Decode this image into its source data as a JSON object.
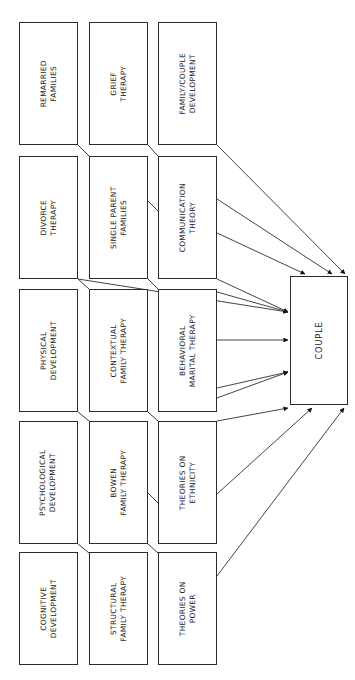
{
  "diagram": {
    "title": "COUPLE",
    "type": "flowchart",
    "orientation": "rotated-90",
    "background_color": "#ffffff",
    "line_color": "#2b2b2b",
    "text_color": "#1a1a1a",
    "center_node": {
      "id": "couple",
      "label": "COUPLE",
      "lines": [
        "COUPLE"
      ],
      "x": 290,
      "y": 276,
      "width": 58,
      "height": 129
    },
    "columns": [
      {
        "id": "col-1",
        "x": 19,
        "width": 59
      },
      {
        "id": "col-2",
        "x": 89,
        "width": 59
      },
      {
        "id": "col-3",
        "x": 158,
        "width": 59
      }
    ],
    "rows": [
      {
        "id": "row-1",
        "y": 22,
        "height": 123
      },
      {
        "id": "row-2",
        "y": 156,
        "height": 123
      },
      {
        "id": "row-3",
        "y": 289,
        "height": 123
      },
      {
        "id": "row-4",
        "y": 421,
        "height": 123
      },
      {
        "id": "row-5",
        "y": 552,
        "height": 113
      }
    ],
    "nodes": [
      {
        "id": "remarried-families",
        "row": 0,
        "col": 0,
        "label": "REMARRIED FAMILIES",
        "lines": [
          "REMARRIED",
          "FAMILIES"
        ]
      },
      {
        "id": "grief-therapy",
        "row": 0,
        "col": 1,
        "label": "GRIEF THERAPY",
        "lines": [
          "GRIEF",
          "THERAPY"
        ]
      },
      {
        "id": "family-couple-development",
        "row": 0,
        "col": 2,
        "label": "FAMILY/COUPLE DEVELOPMENT",
        "lines": [
          "FAMILY/COUPLE",
          "DEVELOPMENT"
        ]
      },
      {
        "id": "divorce-therapy",
        "row": 1,
        "col": 0,
        "label": "DIVORCE THERAPY",
        "lines": [
          "DIVORCE",
          "THERAPY"
        ]
      },
      {
        "id": "single-parent-families",
        "row": 1,
        "col": 1,
        "label": "SINGLE PARENT FAMILIES",
        "lines": [
          "SINGLE PARENT",
          "FAMILIES"
        ]
      },
      {
        "id": "communication-theory",
        "row": 1,
        "col": 2,
        "label": "COMMUNICATION THEORY",
        "lines": [
          "COMMUNICATION",
          "THEORY"
        ]
      },
      {
        "id": "physical-development",
        "row": 2,
        "col": 0,
        "label": "PHYSICAL DEVELOPMENT",
        "lines": [
          "PHYSICAL",
          "DEVELOPMENT"
        ]
      },
      {
        "id": "contextual-family-therapy",
        "row": 2,
        "col": 1,
        "label": "CONTEXTUAL FAMILY THERAPY",
        "lines": [
          "CONTEXTUAL",
          "FAMILY THERAPY"
        ]
      },
      {
        "id": "behavioral-marital-therapy",
        "row": 2,
        "col": 2,
        "label": "BEHAVIORAL MARITAL THERAPY",
        "lines": [
          "BEHAVIORAL",
          "MARITAL THERAPY"
        ]
      },
      {
        "id": "psychological-development",
        "row": 3,
        "col": 0,
        "label": "PSYCHOLOGICAL DEVELOPMENT",
        "lines": [
          "PSYCHOLOGICAL",
          "DEVELOPMENT"
        ]
      },
      {
        "id": "bowen-family-therapy",
        "row": 3,
        "col": 1,
        "label": "BOWEN FAMILY THERAPY",
        "lines": [
          "BOWEN",
          "FAMILY THERAPY"
        ]
      },
      {
        "id": "theories-on-ethnicity",
        "row": 3,
        "col": 2,
        "label": "THEORIES ON ETHNICITY",
        "lines": [
          "THEORIES ON",
          "ETHNICITY"
        ]
      },
      {
        "id": "cognitive-development",
        "row": 4,
        "col": 0,
        "label": "COGNITIVE DEVELOPMENT",
        "lines": [
          "COGNITIVE",
          "DEVELOPMENT"
        ]
      },
      {
        "id": "structural-family-therapy",
        "row": 4,
        "col": 1,
        "label": "STRUCTURAL FAMILY THERAPY",
        "lines": [
          "STRUCTURAL",
          "FAMILY THERAPY"
        ]
      },
      {
        "id": "theories-on-power",
        "row": 4,
        "col": 2,
        "label": "THEORIES ON POWER",
        "lines": [
          "THEORIES ON",
          "POWER"
        ]
      }
    ],
    "connectors": [
      {
        "id": "link-remarried-to-single-parent",
        "from": "remarried-families",
        "to": "single-parent-families",
        "kind": "plain"
      },
      {
        "id": "link-grief-to-communication",
        "from": "grief-therapy",
        "to": "communication-theory",
        "kind": "plain"
      },
      {
        "id": "link-single-parent-to-communication",
        "from": "single-parent-families",
        "to": "communication-theory",
        "kind": "plain"
      },
      {
        "id": "link-divorce-to-contextual",
        "from": "divorce-therapy",
        "to": "contextual-family-therapy",
        "kind": "plain"
      },
      {
        "id": "link-single-parent-to-behavioral",
        "from": "single-parent-families",
        "to": "behavioral-marital-therapy",
        "kind": "plain"
      },
      {
        "id": "link-physical-to-psychological",
        "from": "physical-development",
        "to": "psychological-development",
        "kind": "plain"
      },
      {
        "id": "link-contextual-to-bowen",
        "from": "contextual-family-therapy",
        "to": "bowen-family-therapy",
        "kind": "plain"
      },
      {
        "id": "link-bowen-to-theories-ethnicity",
        "from": "bowen-family-therapy",
        "to": "theories-on-ethnicity",
        "kind": "plain"
      },
      {
        "id": "link-psychological-to-cognitive",
        "from": "psychological-development",
        "to": "cognitive-development",
        "kind": "plain"
      },
      {
        "id": "link-bowen-to-structural",
        "from": "bowen-family-therapy",
        "to": "structural-family-therapy",
        "kind": "plain"
      }
    ],
    "arrows_to_center": [
      {
        "id": "arrow-family-couple-development-to-couple",
        "from": "family-couple-development",
        "to": "couple"
      },
      {
        "id": "arrow-communication-theory-to-couple-a",
        "from": "communication-theory",
        "to": "couple"
      },
      {
        "id": "arrow-communication-theory-to-couple-b",
        "from": "communication-theory",
        "to": "couple"
      },
      {
        "id": "arrow-communication-theory-to-couple-c",
        "from": "communication-theory",
        "to": "couple"
      },
      {
        "id": "arrow-behavioral-marital-therapy-to-couple-a",
        "from": "behavioral-marital-therapy",
        "to": "couple"
      },
      {
        "id": "arrow-behavioral-marital-therapy-to-couple-b",
        "from": "behavioral-marital-therapy",
        "to": "couple"
      },
      {
        "id": "arrow-behavioral-marital-therapy-to-couple-c",
        "from": "behavioral-marital-therapy",
        "to": "couple"
      },
      {
        "id": "arrow-theories-on-ethnicity-to-couple-a",
        "from": "theories-on-ethnicity",
        "to": "couple"
      },
      {
        "id": "arrow-theories-on-ethnicity-to-couple-b",
        "from": "theories-on-ethnicity",
        "to": "couple"
      },
      {
        "id": "arrow-theories-on-power-to-couple",
        "from": "theories-on-power",
        "to": "couple"
      }
    ]
  }
}
